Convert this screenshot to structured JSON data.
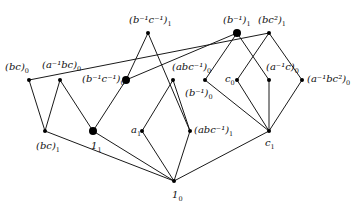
{
  "diagram": {
    "type": "graph",
    "nodes": [
      {
        "id": "bc0",
        "label": "(bc)",
        "exp": "",
        "sub": "0",
        "x": 29,
        "y": 80,
        "big": false,
        "lx": 5,
        "ly": 62
      },
      {
        "id": "a-1bc0",
        "label": "(a⁻¹bc)",
        "sub": "0",
        "x": 60,
        "y": 80,
        "big": false,
        "lx": 42,
        "ly": 60
      },
      {
        "id": "bc1",
        "label": "(bc)",
        "sub": "1",
        "x": 45,
        "y": 131,
        "big": false,
        "lx": 36,
        "ly": 141
      },
      {
        "id": "one1",
        "label": "1",
        "sub": "1",
        "x": 93,
        "y": 131,
        "big": true,
        "lx": 91,
        "ly": 141
      },
      {
        "id": "b-1c-1_1",
        "label": "(b⁻¹c⁻¹)",
        "sub": "1",
        "x": 148,
        "y": 33,
        "big": false,
        "lx": 129,
        "ly": 15
      },
      {
        "id": "b-1c-1_0",
        "label": "(b⁻¹c⁻¹)",
        "sub": "0",
        "x": 126,
        "y": 80,
        "big": true,
        "lx": 82,
        "ly": 74
      },
      {
        "id": "abc-1_0",
        "label": "(abc⁻¹)",
        "sub": "0",
        "x": 173,
        "y": 80,
        "big": false,
        "lx": 172,
        "ly": 62
      },
      {
        "id": "a1",
        "label": "a",
        "sub": "1",
        "x": 142,
        "y": 131,
        "big": false,
        "lx": 131,
        "ly": 125
      },
      {
        "id": "abc-1_1",
        "label": "(abc⁻¹)",
        "sub": "1",
        "x": 190,
        "y": 131,
        "big": false,
        "lx": 194,
        "ly": 125
      },
      {
        "id": "one0",
        "label": "1",
        "sub": "0",
        "x": 174,
        "y": 181,
        "big": false,
        "lx": 172,
        "ly": 190
      },
      {
        "id": "b-1_1",
        "label": "(b⁻¹)",
        "sub": "1",
        "x": 237,
        "y": 33,
        "big": true,
        "lx": 223,
        "ly": 15
      },
      {
        "id": "bc2_1",
        "label": "(bc²)",
        "sub": "1",
        "x": 269,
        "y": 33,
        "big": false,
        "lx": 258,
        "ly": 15
      },
      {
        "id": "b-1_0",
        "label": "(b⁻¹)",
        "sub": "0",
        "x": 205,
        "y": 80,
        "big": false,
        "lx": 185,
        "ly": 88
      },
      {
        "id": "c0",
        "label": "c",
        "sub": "0",
        "x": 237,
        "y": 80,
        "big": false,
        "lx": 225,
        "ly": 74
      },
      {
        "id": "a-1c0",
        "label": "(a⁻¹c)",
        "sub": "0",
        "x": 269,
        "y": 80,
        "big": false,
        "lx": 266,
        "ly": 62
      },
      {
        "id": "a-1bc2_0",
        "label": "(a⁻¹bc²)",
        "sub": "0",
        "x": 302,
        "y": 80,
        "big": false,
        "lx": 307,
        "ly": 74
      },
      {
        "id": "c1",
        "label": "c",
        "sub": "1",
        "x": 269,
        "y": 131,
        "big": false,
        "lx": 265,
        "ly": 138
      }
    ],
    "edges": [
      [
        "bc0",
        "bc1"
      ],
      [
        "bc0",
        "bc2_1"
      ],
      [
        "a-1bc0",
        "bc1"
      ],
      [
        "a-1bc0",
        "one1"
      ],
      [
        "b-1c-1_0",
        "one1"
      ],
      [
        "b-1c-1_0",
        "b-1c-1_1"
      ],
      [
        "b-1c-1_0",
        "b-1_1"
      ],
      [
        "b-1c-1_1",
        "abc-1_1"
      ],
      [
        "abc-1_0",
        "a1"
      ],
      [
        "abc-1_0",
        "abc-1_1"
      ],
      [
        "bc1",
        "one0"
      ],
      [
        "one1",
        "one0"
      ],
      [
        "a1",
        "one0"
      ],
      [
        "abc-1_1",
        "one0"
      ],
      [
        "c1",
        "one0"
      ],
      [
        "b-1_1",
        "b-1_0"
      ],
      [
        "b-1_1",
        "a-1c0"
      ],
      [
        "bc2_1",
        "c0"
      ],
      [
        "bc2_1",
        "a-1bc2_0"
      ],
      [
        "b-1_0",
        "c1"
      ],
      [
        "c0",
        "c1"
      ],
      [
        "a-1c0",
        "c1"
      ],
      [
        "a-1bc2_0",
        "c1"
      ]
    ],
    "colors": {
      "line": "#1a1a1a",
      "node": "#000000"
    }
  }
}
